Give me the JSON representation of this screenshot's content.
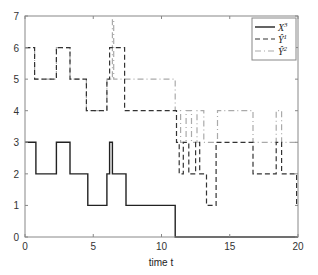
{
  "chart_data": {
    "type": "line",
    "step": true,
    "title": "",
    "xlabel": "time t",
    "ylabel": "",
    "xlim": [
      0,
      20
    ],
    "ylim": [
      0,
      7
    ],
    "xticks": [
      0,
      5,
      10,
      15,
      20
    ],
    "yticks": [
      0,
      1,
      2,
      3,
      4,
      5,
      6,
      7
    ],
    "grid": false,
    "legend_position": "upper right",
    "series": [
      {
        "name": "X_t^3",
        "label_html": "X",
        "sup": "3",
        "style": "solid",
        "color": "#222222",
        "points": [
          [
            0,
            3
          ],
          [
            0.8,
            3
          ],
          [
            0.8,
            2
          ],
          [
            2.3,
            2
          ],
          [
            2.3,
            3
          ],
          [
            3.3,
            3
          ],
          [
            3.3,
            2
          ],
          [
            4.6,
            2
          ],
          [
            4.6,
            1
          ],
          [
            6.0,
            1
          ],
          [
            6.0,
            2
          ],
          [
            6.2,
            2
          ],
          [
            6.2,
            3
          ],
          [
            6.4,
            3
          ],
          [
            6.4,
            2
          ],
          [
            7.4,
            2
          ],
          [
            7.4,
            1
          ],
          [
            11.0,
            1
          ],
          [
            11.0,
            0
          ],
          [
            20,
            0
          ]
        ]
      },
      {
        "name": "Ŷ_t^1",
        "label_html": "Ŷ",
        "sup": "1",
        "style": "dashed",
        "color": "#333333",
        "points": [
          [
            0,
            6
          ],
          [
            0.7,
            6
          ],
          [
            0.7,
            5
          ],
          [
            2.3,
            5
          ],
          [
            2.3,
            6
          ],
          [
            3.3,
            6
          ],
          [
            3.3,
            5
          ],
          [
            4.5,
            5
          ],
          [
            4.5,
            4
          ],
          [
            6.0,
            4
          ],
          [
            6.0,
            5
          ],
          [
            6.2,
            5
          ],
          [
            6.2,
            6
          ],
          [
            7.3,
            6
          ],
          [
            7.3,
            4
          ],
          [
            11.1,
            4
          ],
          [
            11.1,
            3
          ],
          [
            11.3,
            3
          ],
          [
            11.3,
            2
          ],
          [
            11.6,
            2
          ],
          [
            11.6,
            3
          ],
          [
            12.0,
            3
          ],
          [
            12.0,
            2
          ],
          [
            12.5,
            2
          ],
          [
            12.5,
            3
          ],
          [
            12.8,
            3
          ],
          [
            12.8,
            2
          ],
          [
            13.3,
            2
          ],
          [
            13.3,
            1
          ],
          [
            14.0,
            1
          ],
          [
            14.0,
            3
          ],
          [
            16.7,
            3
          ],
          [
            16.7,
            2
          ],
          [
            18.4,
            2
          ],
          [
            18.4,
            3
          ],
          [
            18.8,
            3
          ],
          [
            18.8,
            2
          ],
          [
            19.9,
            2
          ],
          [
            19.9,
            1
          ],
          [
            20,
            1
          ]
        ]
      },
      {
        "name": "Ŷ_t^2",
        "label_html": "Ŷ",
        "sup": "2",
        "style": "dashdot",
        "color": "#aaaaaa",
        "points": [
          [
            0,
            6
          ],
          [
            0.7,
            6
          ],
          [
            0.7,
            5
          ],
          [
            2.3,
            5
          ],
          [
            2.3,
            6
          ],
          [
            3.3,
            6
          ],
          [
            3.3,
            5
          ],
          [
            4.5,
            5
          ],
          [
            4.5,
            4
          ],
          [
            6.0,
            4
          ],
          [
            6.0,
            5
          ],
          [
            6.4,
            5
          ],
          [
            6.4,
            6.9
          ],
          [
            6.5,
            6.9
          ],
          [
            6.5,
            5
          ],
          [
            11.0,
            5
          ],
          [
            11.0,
            4
          ],
          [
            11.4,
            4
          ],
          [
            11.4,
            3
          ],
          [
            11.8,
            3
          ],
          [
            11.8,
            4
          ],
          [
            12.2,
            4
          ],
          [
            12.2,
            3
          ],
          [
            12.6,
            3
          ],
          [
            12.6,
            4
          ],
          [
            13.1,
            4
          ],
          [
            13.1,
            3
          ],
          [
            14.1,
            3
          ],
          [
            14.1,
            4
          ],
          [
            16.7,
            4
          ],
          [
            16.7,
            3
          ],
          [
            18.4,
            3
          ],
          [
            18.4,
            4
          ],
          [
            18.8,
            4
          ],
          [
            18.8,
            3
          ],
          [
            20,
            3
          ]
        ]
      }
    ]
  }
}
